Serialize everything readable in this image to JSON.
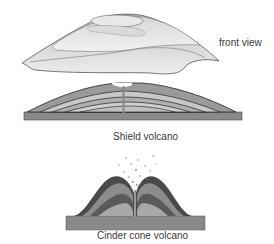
{
  "diagram": {
    "shield": {
      "front_label": "front view",
      "side_label": "side view",
      "caption": "Shield volcano"
    },
    "cinder": {
      "caption": "Cinder cone volcano"
    }
  },
  "colors": {
    "outline": "#3a3a3a",
    "ground": "#8a8a8a",
    "layer_dark": "#555555",
    "layer_mid": "#9a9a9a",
    "layer_light": "#c8c8c8",
    "surface_light": "#e2e2e2"
  }
}
